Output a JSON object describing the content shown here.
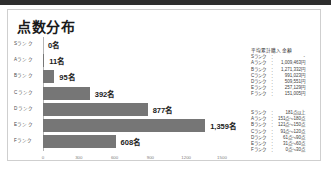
{
  "card": {
    "title": "点数分布"
  },
  "chart_data": {
    "type": "bar",
    "orientation": "horizontal",
    "title": "点数分布",
    "xlabel": "",
    "ylabel": "",
    "categories": [
      "Sランク",
      "Aランク",
      "Bランク",
      "Cランク",
      "Dランク",
      "Eランク",
      "Fランク"
    ],
    "values": [
      0,
      11,
      95,
      392,
      877,
      1359,
      608
    ],
    "value_labels": [
      "0名",
      "11名",
      "95名",
      "392名",
      "877名",
      "1,359名",
      "608名"
    ],
    "xlim": [
      0,
      1500
    ],
    "xticks": [
      0,
      300,
      600,
      900,
      1200,
      1500
    ],
    "xtick_labels": [
      "0",
      "300",
      "600",
      "900",
      "1200",
      "1500"
    ],
    "grid": false,
    "legend": false,
    "bar_color": "#767676"
  },
  "info_amount": {
    "heading": "平均累計購入金額",
    "rows": [
      {
        "label": "Sランク",
        "sep": "：",
        "value": "-"
      },
      {
        "label": "Aランク",
        "sep": "：",
        "value": "1,009,463円"
      },
      {
        "label": "Bランク",
        "sep": "：",
        "value": "1,271,332円"
      },
      {
        "label": "Cランク",
        "sep": "：",
        "value": "991,023円"
      },
      {
        "label": "Dランク",
        "sep": "：",
        "value": "509,551円"
      },
      {
        "label": "Eランク",
        "sep": "：",
        "value": "257,129円"
      },
      {
        "label": "Fランク",
        "sep": "：",
        "value": "151,005円"
      }
    ]
  },
  "info_range": {
    "rows": [
      {
        "label": "Sランク",
        "sep": "：",
        "value": "181点以上"
      },
      {
        "label": "Aランク",
        "sep": "：",
        "value": "151点～180点"
      },
      {
        "label": "Bランク",
        "sep": "：",
        "value": "121点～150点"
      },
      {
        "label": "Cランク",
        "sep": "：",
        "value": "91点～120点"
      },
      {
        "label": "Dランク",
        "sep": "：",
        "value": "61点～90点"
      },
      {
        "label": "Eランク",
        "sep": "：",
        "value": "31点～60点"
      },
      {
        "label": "Fランク",
        "sep": "：",
        "value": "0点～30点"
      }
    ]
  }
}
